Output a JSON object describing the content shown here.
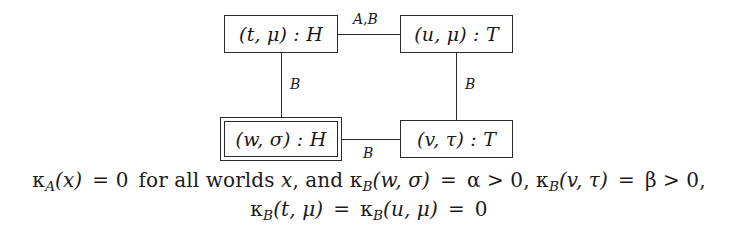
{
  "figure": {
    "type": "labeled-graph-diagram",
    "nodes": [
      {
        "id": "top-left",
        "label": "(t, μ) : H",
        "border": "single"
      },
      {
        "id": "top-right",
        "label": "(u, μ) : T",
        "border": "single"
      },
      {
        "id": "bottom-left",
        "label": "(w, σ) : H",
        "border": "double"
      },
      {
        "id": "bottom-right",
        "label": "(v, τ) : T",
        "border": "single"
      }
    ],
    "edges": [
      {
        "id": "top-horizontal",
        "from": "top-left",
        "to": "top-right",
        "label": "A,B",
        "orientation": "horizontal"
      },
      {
        "id": "bottom-horizontal",
        "from": "bottom-left",
        "to": "bottom-right",
        "label": "B",
        "orientation": "horizontal"
      },
      {
        "id": "left-vertical",
        "from": "top-left",
        "to": "bottom-left",
        "label": "B",
        "orientation": "vertical"
      },
      {
        "id": "right-vertical",
        "from": "top-right",
        "to": "bottom-right",
        "label": "B",
        "orientation": "vertical"
      }
    ],
    "line_color": "#2a2a2a",
    "background_color": "#ffffff"
  },
  "caption": {
    "line1": {
      "kappa": "κ",
      "sub_a": "A",
      "arg_x": "(x)",
      "eq_zero": "= 0",
      "text_for_all_worlds": "for all worlds",
      "var_x": "x",
      "comma_and": ", and",
      "sub_b1": "B",
      "arg_wsigma": "(w, σ)",
      "eq1": "=",
      "alpha": "α",
      "gt1": "> 0,",
      "sub_b2": "B",
      "arg_vtau": "(v, τ)",
      "eq2": "=",
      "beta": "β",
      "gt2": "> 0,",
      "plain": "κA(x) = 0 for all worlds x, and κB(w,σ) = α > 0, κB(v,τ) = β > 0,"
    },
    "line2": {
      "kappa": "κ",
      "sub_b1": "B",
      "arg_tmu": "(t, μ)",
      "eq1": "=",
      "sub_b2": "B",
      "arg_umu": "(u, μ)",
      "eq2": "=",
      "zero": "0",
      "plain": "κB(t,μ) = κB(u,μ) = 0"
    }
  }
}
